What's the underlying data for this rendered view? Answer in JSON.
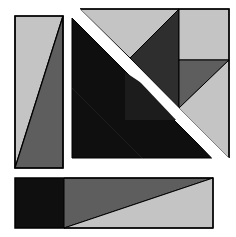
{
  "diagram": {
    "colors": {
      "background": "#ffffff",
      "light_gray": "#c4c4c4",
      "mid_gray": "#5e5e5e",
      "dark_gray": "#2e2e2e",
      "black": "#0f0f0f",
      "outline": "#000000"
    },
    "pieces": [
      {
        "id": "left-rectangle",
        "bounds": [
          15,
          16,
          63,
          168
        ],
        "split": "diagonal from bottom-left to top-right",
        "fills": [
          "light_gray",
          "mid_gray"
        ]
      },
      {
        "id": "top-right-square",
        "bounds": [
          80,
          9,
          229,
          158
        ],
        "description": "square cut by a white diagonal band from top-left to bottom-right",
        "sub_pieces": [
          {
            "shape": "triangle",
            "fill": "light_gray",
            "note": "upper-left top triangle"
          },
          {
            "shape": "triangle",
            "fill": "dark_gray",
            "note": "central dark triangle"
          },
          {
            "shape": "rectangle",
            "fill": "light_gray",
            "note": "top-right square"
          },
          {
            "shape": "triangle",
            "fill": "mid_gray",
            "note": "right mid triangle"
          },
          {
            "shape": "triangle",
            "fill": "light_gray",
            "note": "lower-right triangle"
          },
          {
            "shape": "triangle",
            "fill": "black",
            "note": "large lower-left triangle"
          }
        ]
      },
      {
        "id": "bottom-rectangle",
        "bounds": [
          15,
          178,
          213,
          228
        ],
        "split": "dark square on left, then diagonal from bottom-left to top-right",
        "fills": [
          "black",
          "mid_gray",
          "light_gray"
        ]
      }
    ]
  }
}
